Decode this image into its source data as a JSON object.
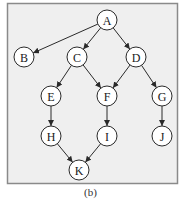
{
  "caption": "(b)",
  "colors": {
    "frame_fill": "#efefef",
    "frame_stroke": "#8a8a8a",
    "node_fill": "#ffffff",
    "edge": "#2a2a2a"
  },
  "nodes": [
    {
      "id": "A",
      "label": "A",
      "x": 107,
      "y": 20
    },
    {
      "id": "B",
      "label": "B",
      "x": 24,
      "y": 57
    },
    {
      "id": "C",
      "label": "C",
      "x": 77,
      "y": 57
    },
    {
      "id": "D",
      "label": "D",
      "x": 136,
      "y": 57
    },
    {
      "id": "E",
      "label": "E",
      "x": 51,
      "y": 96
    },
    {
      "id": "F",
      "label": "F",
      "x": 107,
      "y": 96
    },
    {
      "id": "G",
      "label": "G",
      "x": 162,
      "y": 96
    },
    {
      "id": "H",
      "label": "H",
      "x": 51,
      "y": 136
    },
    {
      "id": "I",
      "label": "I",
      "x": 107,
      "y": 136
    },
    {
      "id": "J",
      "label": "J",
      "x": 162,
      "y": 136
    },
    {
      "id": "K",
      "label": "K",
      "x": 79,
      "y": 170
    }
  ],
  "edges": [
    {
      "from": "A",
      "to": "B"
    },
    {
      "from": "A",
      "to": "C"
    },
    {
      "from": "A",
      "to": "D"
    },
    {
      "from": "C",
      "to": "E"
    },
    {
      "from": "C",
      "to": "F"
    },
    {
      "from": "D",
      "to": "F"
    },
    {
      "from": "D",
      "to": "G"
    },
    {
      "from": "E",
      "to": "H"
    },
    {
      "from": "F",
      "to": "I"
    },
    {
      "from": "G",
      "to": "J"
    },
    {
      "from": "H",
      "to": "K"
    },
    {
      "from": "I",
      "to": "K"
    }
  ]
}
